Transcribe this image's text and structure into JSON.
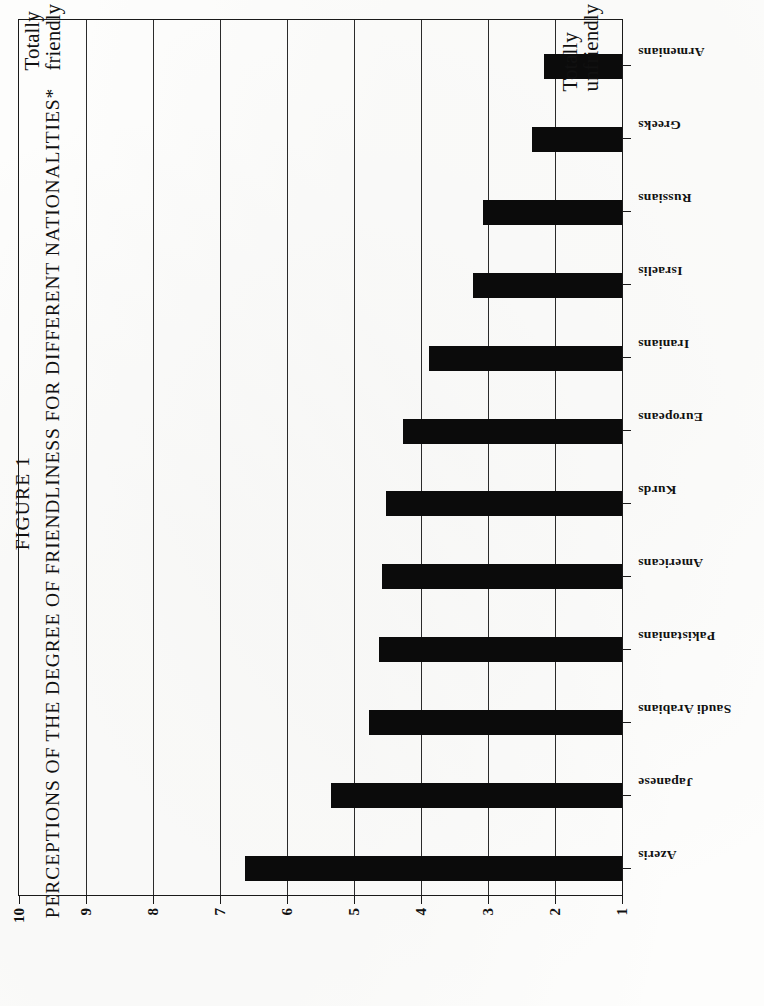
{
  "figure": {
    "number_label": "FIGURE 1",
    "title": "PERCEPTIONS OF THE DEGREE OF FRIENDLINESS FOR DIFFERENT NATIONALITIES*"
  },
  "annotations": {
    "top": {
      "line1": "Totally",
      "line2": "friendly"
    },
    "bottom": {
      "line1": "Totally",
      "line2": "unfriendly"
    }
  },
  "colors": {
    "bar": "#0b0b0b",
    "axis": "#1a1a1a",
    "grid": "#2b2b2b",
    "page": "#fdfdfc"
  },
  "chart_data": {
    "type": "bar",
    "title": "PERCEPTIONS OF THE DEGREE OF FRIENDLINESS FOR DIFFERENT NATIONALITIES*",
    "xlabel": "",
    "ylabel": "",
    "orientation": "vertical",
    "grid": true,
    "legend": null,
    "ylim": [
      1,
      10
    ],
    "yticks": [
      1,
      2,
      3,
      4,
      5,
      6,
      7,
      8,
      9,
      10
    ],
    "ytick_labels": [
      "1",
      "2",
      "3",
      "4",
      "5",
      "6",
      "7",
      "8",
      "9",
      "10"
    ],
    "scale_anchors": {
      "low": "Totally unfriendly",
      "high": "Totally friendly"
    },
    "categories": [
      "Azeris",
      "Japanese",
      "Saudi Arabians",
      "Pakistanians",
      "Americans",
      "Kurds",
      "Europeans",
      "Iranians",
      "Israelis",
      "Russians",
      "Greeks",
      "Armenians"
    ],
    "values": [
      6.62,
      5.35,
      4.78,
      4.62,
      4.58,
      4.53,
      4.27,
      3.88,
      3.23,
      3.07,
      2.35,
      2.17
    ]
  }
}
